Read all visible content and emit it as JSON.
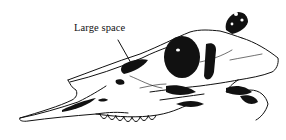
{
  "figure": {
    "labels": [
      {
        "text": "Large space",
        "target": "preorbital vacuity"
      }
    ]
  },
  "colors": {
    "ink": "#111111",
    "background": "#ffffff"
  }
}
